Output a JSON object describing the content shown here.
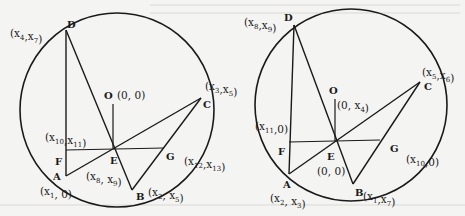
{
  "figures": [
    {
      "id": "left",
      "points": {
        "D": {
          "name": "D",
          "coord": "(x4,x7)"
        },
        "C": {
          "name": "C",
          "coord": "(x3,x5)"
        },
        "O": {
          "name": "O",
          "coord": "(0, 0)"
        },
        "F": {
          "name": "F",
          "coord": "(x10,x11)"
        },
        "E": {
          "name": "E",
          "coord": "(x8, x9)"
        },
        "G": {
          "name": "G",
          "coord": "(x12,x13)"
        },
        "A": {
          "name": "A",
          "coord": "(x1, 0)"
        },
        "B": {
          "name": "B",
          "coord": "(x2, x5)"
        }
      }
    },
    {
      "id": "right",
      "points": {
        "D": {
          "name": "D",
          "coord": "(x8,x9)"
        },
        "C": {
          "name": "C",
          "coord": "(x5,x6)"
        },
        "O": {
          "name": "O",
          "coord": "(0, x4)"
        },
        "F": {
          "name": "F",
          "coord": "(x11,0)"
        },
        "E": {
          "name": "E",
          "coord": "(0, 0)"
        },
        "G": {
          "name": "G",
          "coord": "(x10,0)"
        },
        "A": {
          "name": "A",
          "coord": "(x2, x3)"
        },
        "B": {
          "name": "B",
          "coord": "(x1,x7)"
        }
      }
    }
  ],
  "colors": {
    "ink": "#1a1a1a",
    "paper": "#f4f4f2"
  }
}
